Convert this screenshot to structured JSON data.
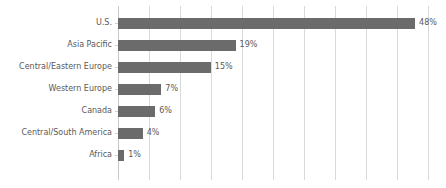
{
  "chart_data": {
    "type": "bar",
    "orientation": "horizontal",
    "title": "",
    "subtitle": "",
    "xlabel": "",
    "ylabel": "",
    "categories": [
      "U.S.",
      "Asia Pacific",
      "Central/Eastern Europe",
      "Western Europe",
      "Canada",
      "Central/South America",
      "Africa"
    ],
    "values": [
      48,
      19,
      15,
      7,
      6,
      4,
      1
    ],
    "data_labels": [
      "48%",
      "19%",
      "15%",
      "7%",
      "6%",
      "4%",
      "1%"
    ],
    "unit": "%",
    "xlim": [
      0,
      50
    ],
    "xticks": [
      0,
      5,
      10,
      15,
      20,
      25,
      30,
      35,
      40,
      45,
      50
    ],
    "xtick_labels": [
      "",
      "",
      "",
      "",
      "",
      "",
      "",
      "",
      "",
      "",
      ""
    ],
    "grid": "vertical",
    "legend": "none",
    "annotations": [],
    "colors": {
      "bar": "#6b6b6b",
      "gridline": "#d9d9d9",
      "axis": "#c9c9c9",
      "label_text": "#595959",
      "background": "#ffffff"
    }
  }
}
